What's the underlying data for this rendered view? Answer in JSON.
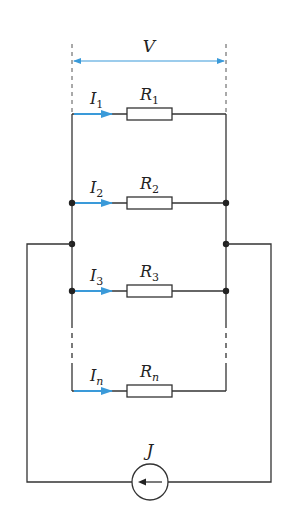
{
  "diagram": {
    "type": "parallel resistor circuit with current source",
    "colors": {
      "wire": "#333333",
      "current_arrow": "#3a9ad9",
      "voltage_arrow": "#3a9ad9",
      "background": "#ffffff"
    },
    "voltage": {
      "symbol": "V"
    },
    "source": {
      "symbol": "J",
      "kind": "current-source",
      "direction": "left"
    },
    "branches": [
      {
        "current": "I",
        "current_sub": "1",
        "resistor": "R",
        "resistor_sub": "1"
      },
      {
        "current": "I",
        "current_sub": "2",
        "resistor": "R",
        "resistor_sub": "2"
      },
      {
        "current": "I",
        "current_sub": "3",
        "resistor": "R",
        "resistor_sub": "3"
      },
      {
        "current": "I",
        "current_sub": "n",
        "resistor": "R",
        "resistor_sub": "n"
      }
    ]
  }
}
